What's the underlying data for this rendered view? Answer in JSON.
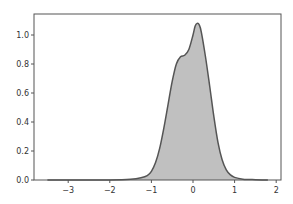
{
  "header_fragment": "",
  "chart_data": {
    "type": "area",
    "title": "",
    "xlabel": "",
    "ylabel": "",
    "xlim": [
      -3.75,
      2.1
    ],
    "ylim": [
      0,
      1.14
    ],
    "grid": false,
    "legend": null,
    "xticks": [
      -3,
      -2,
      -1,
      0,
      1,
      2
    ],
    "xtick_labels": [
      "−3",
      "−2",
      "−1",
      "0",
      "1",
      "2"
    ],
    "yticks": [
      0.0,
      0.2,
      0.4,
      0.6,
      0.8,
      1.0
    ],
    "ytick_labels": [
      "0.0",
      "0.2",
      "0.4",
      "0.6",
      "0.8",
      "1.0"
    ],
    "series": [
      {
        "name": "density",
        "fill_color": "#c0c0c0",
        "line_color": "#555555",
        "x": [
          -3.5,
          -3.0,
          -2.5,
          -2.0,
          -1.5,
          -1.25,
          -1.1,
          -1.0,
          -0.9,
          -0.8,
          -0.7,
          -0.6,
          -0.5,
          -0.4,
          -0.3,
          -0.2,
          -0.1,
          0.0,
          0.05,
          0.1,
          0.15,
          0.2,
          0.3,
          0.4,
          0.5,
          0.6,
          0.7,
          0.8,
          0.9,
          1.0,
          1.2,
          1.5,
          1.8
        ],
        "y": [
          0.0,
          0.0,
          0.0,
          0.0,
          0.005,
          0.015,
          0.03,
          0.06,
          0.12,
          0.22,
          0.36,
          0.52,
          0.68,
          0.8,
          0.85,
          0.86,
          0.9,
          1.0,
          1.06,
          1.08,
          1.07,
          1.02,
          0.85,
          0.65,
          0.44,
          0.26,
          0.14,
          0.07,
          0.035,
          0.018,
          0.006,
          0.002,
          0.0
        ]
      }
    ]
  }
}
